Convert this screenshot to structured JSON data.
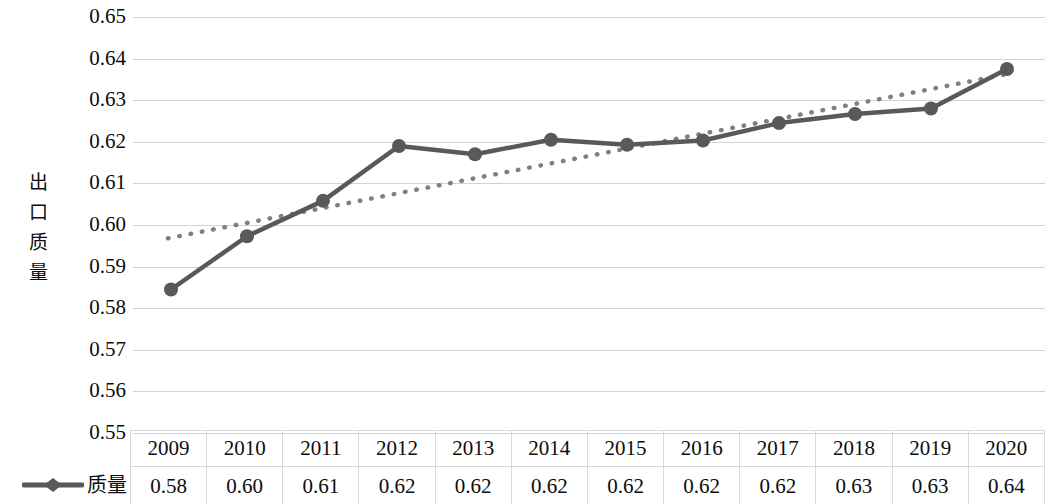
{
  "chart_data": {
    "type": "line",
    "title": "",
    "xlabel": "",
    "ylabel": "出口质量",
    "ylim": [
      0.55,
      0.65
    ],
    "ytick_step": 0.01,
    "grid": true,
    "legend_position": "bottom-left",
    "categories": [
      "2009",
      "2010",
      "2011",
      "2012",
      "2013",
      "2014",
      "2015",
      "2016",
      "2017",
      "2018",
      "2019",
      "2020"
    ],
    "ytick_labels": [
      "0.65",
      "0.64",
      "0.63",
      "0.62",
      "0.61",
      "0.60",
      "0.59",
      "0.58",
      "0.57",
      "0.56",
      "0.55"
    ],
    "series": [
      {
        "name": "质量",
        "style": "line-with-markers",
        "color": "#595959",
        "values": [
          0.5845,
          0.5973,
          0.6058,
          0.619,
          0.617,
          0.6205,
          0.6193,
          0.6203,
          0.6245,
          0.6267,
          0.628,
          0.6375
        ],
        "labels": [
          "0.58",
          "0.60",
          "0.61",
          "0.62",
          "0.62",
          "0.62",
          "0.62",
          "0.62",
          "0.62",
          "0.63",
          "0.63",
          "0.64"
        ]
      },
      {
        "name": "trendline",
        "style": "dotted",
        "color": "#808080",
        "endpoints": [
          0.5968,
          0.6365
        ]
      }
    ]
  },
  "axis": {
    "title": "出口质量",
    "ticks": [
      "0.65",
      "0.64",
      "0.63",
      "0.62",
      "0.61",
      "0.60",
      "0.59",
      "0.58",
      "0.57",
      "0.56",
      "0.55"
    ]
  },
  "table": {
    "years": [
      "2009",
      "2010",
      "2011",
      "2012",
      "2013",
      "2014",
      "2015",
      "2016",
      "2017",
      "2018",
      "2019",
      "2020"
    ],
    "values": [
      "0.58",
      "0.60",
      "0.61",
      "0.62",
      "0.62",
      "0.62",
      "0.62",
      "0.62",
      "0.62",
      "0.63",
      "0.63",
      "0.64"
    ]
  },
  "legend": {
    "label": "质量",
    "marker_icon": "line-diamond-marker-icon",
    "color": "#595959"
  },
  "colors": {
    "series": "#595959",
    "trendline": "#808080",
    "gridline": "#d2d2d2",
    "table_border": "#d9d9d9",
    "text": "#0d0d0d"
  }
}
